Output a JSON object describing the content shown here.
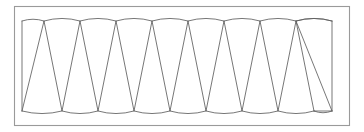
{
  "figure": {
    "kind": "geometric-line-diagram",
    "colors": {
      "background": "#ffffff",
      "frame_stroke": "#9a9a9a",
      "line_stroke": "#5f5f5f"
    },
    "canvas": {
      "width": 364,
      "height": 132
    },
    "frame": {
      "x": 14.5,
      "y": 6.5,
      "width": 335,
      "height": 119
    },
    "band": {
      "top_y": 21,
      "bottom_y": 111,
      "left_x": 22,
      "right_x": 332,
      "arc_bulge": 2.6,
      "triangle_count": 16,
      "top_vertex_count": 8,
      "bottom_vertex_count": 9,
      "top_vertices_x": [
        44,
        80,
        116,
        152,
        188,
        224,
        260,
        296
      ],
      "bottom_vertices_x": [
        22,
        62,
        98,
        134,
        170,
        206,
        242,
        278,
        314
      ],
      "top_arc_spans": [
        [
          44,
          80
        ],
        [
          80,
          116
        ],
        [
          116,
          152
        ],
        [
          152,
          188
        ],
        [
          188,
          224
        ],
        [
          224,
          260
        ],
        [
          260,
          296
        ],
        [
          296,
          332
        ]
      ],
      "bottom_arc_spans": [
        [
          22,
          62
        ],
        [
          62,
          98
        ],
        [
          98,
          134
        ],
        [
          134,
          170
        ],
        [
          170,
          206
        ],
        [
          206,
          242
        ],
        [
          242,
          278
        ],
        [
          278,
          314
        ]
      ],
      "zigzag_path_points": [
        [
          22,
          111
        ],
        [
          44,
          21
        ],
        [
          62,
          111
        ],
        [
          80,
          21
        ],
        [
          98,
          111
        ],
        [
          116,
          21
        ],
        [
          134,
          111
        ],
        [
          152,
          21
        ],
        [
          170,
          111
        ],
        [
          188,
          21
        ],
        [
          206,
          111
        ],
        [
          224,
          21
        ],
        [
          242,
          111
        ],
        [
          260,
          21
        ],
        [
          278,
          111
        ],
        [
          296,
          21
        ],
        [
          314,
          111
        ]
      ],
      "top_left_stub": [
        [
          22,
          21
        ],
        [
          44,
          21
        ]
      ],
      "top_right_stub": [
        [
          296,
          21
        ],
        [
          332,
          21
        ]
      ],
      "bottom_right_stub": [
        [
          314,
          111
        ],
        [
          332,
          111
        ]
      ],
      "closing_edge": [
        [
          332,
          21
        ],
        [
          332,
          111
        ]
      ],
      "left_edge": [
        [
          22,
          21
        ],
        [
          22,
          111
        ]
      ]
    }
  }
}
